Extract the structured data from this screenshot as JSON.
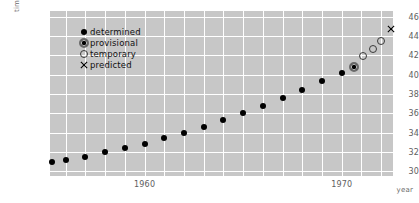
{
  "chart_data": {
    "type": "scatter",
    "title": "",
    "xlabel": "year",
    "ylabel": "time (sec)",
    "xlim": [
      1955.2,
      1972.6
    ],
    "ylim": [
      29.5,
      46.6
    ],
    "xticks": [
      1960,
      1970
    ],
    "xtick_labels": [
      "1960",
      "1970"
    ],
    "yticks": [
      30,
      32,
      34,
      36,
      38,
      40,
      42,
      44,
      46
    ],
    "ytick_labels": [
      "30",
      "32",
      "34",
      "36",
      "38",
      "40",
      "42",
      "44",
      "46"
    ],
    "grid": true,
    "grid_color": "#ffffff",
    "plot_bg": "#c7c7c7",
    "legend_position": "upper left",
    "series": [
      {
        "name": "determined",
        "marker": "filled-dot",
        "points": [
          {
            "x": 1955.3,
            "y": 31.0
          },
          {
            "x": 1956.0,
            "y": 31.2
          },
          {
            "x": 1957.0,
            "y": 31.5
          },
          {
            "x": 1958.0,
            "y": 32.0
          },
          {
            "x": 1959.0,
            "y": 32.4
          },
          {
            "x": 1960.0,
            "y": 32.8
          },
          {
            "x": 1961.0,
            "y": 33.4
          },
          {
            "x": 1962.0,
            "y": 34.0
          },
          {
            "x": 1963.0,
            "y": 34.6
          },
          {
            "x": 1964.0,
            "y": 35.3
          },
          {
            "x": 1965.0,
            "y": 36.0
          },
          {
            "x": 1966.0,
            "y": 36.8
          },
          {
            "x": 1967.0,
            "y": 37.6
          },
          {
            "x": 1968.0,
            "y": 38.4
          },
          {
            "x": 1969.0,
            "y": 39.3
          },
          {
            "x": 1970.0,
            "y": 40.2
          }
        ]
      },
      {
        "name": "provisional",
        "marker": "dot-in-circle",
        "points": [
          {
            "x": 1970.6,
            "y": 40.8
          }
        ]
      },
      {
        "name": "temporary",
        "marker": "open-circle",
        "points": [
          {
            "x": 1971.1,
            "y": 41.9
          },
          {
            "x": 1971.6,
            "y": 42.7
          },
          {
            "x": 1972.0,
            "y": 43.5
          }
        ]
      },
      {
        "name": "predicted",
        "marker": "cross",
        "points": [
          {
            "x": 1972.5,
            "y": 44.7
          }
        ]
      }
    ]
  },
  "legend": {
    "items": [
      {
        "label": "determined",
        "marker": "filled-dot"
      },
      {
        "label": "provisional",
        "marker": "dot-in-circle"
      },
      {
        "label": "temporary",
        "marker": "open-circle"
      },
      {
        "label": "predicted",
        "marker": "cross"
      }
    ]
  }
}
